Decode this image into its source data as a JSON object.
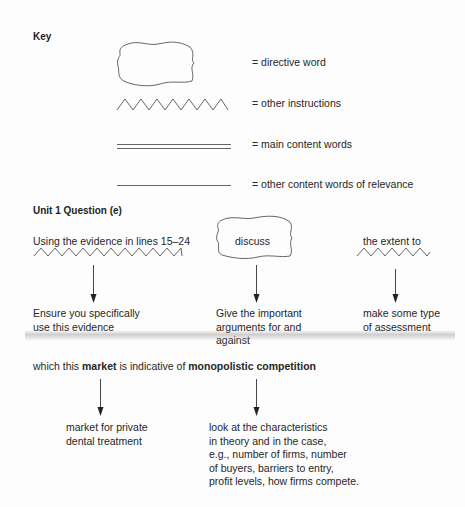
{
  "key": {
    "heading": "Key",
    "items": [
      {
        "symbol": "cloud",
        "label": "= directive word"
      },
      {
        "symbol": "zigzag",
        "label": "= other instructions"
      },
      {
        "symbol": "double-underline",
        "label": "= main content words"
      },
      {
        "symbol": "single-underline",
        "label": "= other content words of relevance"
      }
    ]
  },
  "question": {
    "heading": "Unit 1 Question (e)",
    "row1": [
      {
        "text": "Using the evidence in lines 15–24",
        "marker": "zigzag",
        "note_lines": [
          "Ensure you specifically",
          "use this evidence"
        ]
      },
      {
        "text": "discuss",
        "marker": "cloud",
        "note_lines": [
          "Give the important",
          "arguments for and",
          "against"
        ]
      },
      {
        "text": "the extent to",
        "marker": "zigzag",
        "note_lines": [
          "make some type",
          "of assessment"
        ]
      }
    ],
    "row2": {
      "parts": {
        "p1": "which this ",
        "p2": "market",
        "p3": " is indicative of ",
        "p4": "monopolistic competition"
      },
      "notes": [
        {
          "target": "market",
          "note_lines": [
            "market for private",
            "dental treatment"
          ]
        },
        {
          "target": "monopolistic competition",
          "note_lines": [
            "look at the characteristics",
            "in theory and in the case,",
            "e.g., number of firms, number",
            "of buyers, barriers to entry,",
            "profit levels, how firms compete."
          ]
        }
      ]
    }
  },
  "colors": {
    "text": "#262626",
    "line": "#555555",
    "background": "#fdfdfd"
  }
}
